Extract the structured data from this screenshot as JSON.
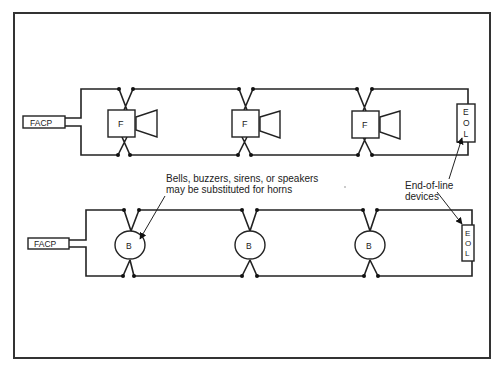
{
  "diagram": {
    "title": "",
    "circuits": [
      {
        "id": "top-horn-circuit",
        "panel_label": "FACP",
        "devices": [
          {
            "type": "horn-strobe",
            "label": "F"
          },
          {
            "type": "horn-strobe",
            "label": "F"
          },
          {
            "type": "horn-strobe",
            "label": "F"
          }
        ],
        "end_of_line": {
          "label": "E O L",
          "letters": [
            "E",
            "O",
            "L"
          ]
        }
      },
      {
        "id": "bottom-bell-circuit",
        "panel_label": "FACP",
        "devices": [
          {
            "type": "bell",
            "label": "B"
          },
          {
            "type": "bell",
            "label": "B"
          },
          {
            "type": "bell",
            "label": "B"
          }
        ],
        "end_of_line": {
          "label": "E O L",
          "letters": [
            "E",
            "O",
            "L"
          ]
        }
      }
    ],
    "annotations": {
      "substitution_note_line1": "Bells, buzzers, sirens, or speakers",
      "substitution_note_line2": "may be substituted for horns",
      "eol_note_line1": "End-of-line",
      "eol_note_line2": "devices"
    },
    "colors": {
      "line": "#222222",
      "background": "#ffffff"
    }
  }
}
